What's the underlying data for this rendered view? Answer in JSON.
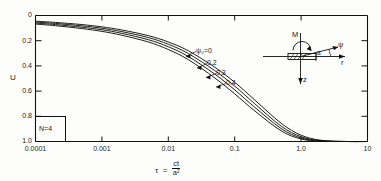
{
  "chart_data": {
    "type": "line",
    "title": "",
    "xlabel": "τ = ct/a²",
    "ylabel": "U",
    "xscale": "log",
    "xlim": [
      0.0001,
      10
    ],
    "ylim": [
      0,
      1.0
    ],
    "y_inverted": true,
    "grid": false,
    "legend_position": "inline-labels",
    "xticks": [
      0.0001,
      0.001,
      0.01,
      0.1,
      1.0,
      10
    ],
    "xticklabels": [
      "0.0001",
      "0.001",
      "0.01",
      "0.1",
      "1.0",
      "10"
    ],
    "yticks": [
      0,
      0.2,
      0.4,
      0.6,
      0.8,
      1.0
    ],
    "yticklabels": [
      "0",
      "0.2",
      "0.4",
      "0.6",
      "0.8",
      "1.0"
    ],
    "annotations": [
      {
        "name": "n-value-box",
        "text": "N=4"
      }
    ],
    "series": [
      {
        "name": "ψ=0",
        "label": "ψ₀=0",
        "x": [
          0.0001,
          0.0002,
          0.0005,
          0.001,
          0.002,
          0.005,
          0.01,
          0.02,
          0.05,
          0.1,
          0.2,
          0.5,
          1.0,
          2.0,
          5.0,
          10.0
        ],
        "y": [
          0.045,
          0.055,
          0.072,
          0.09,
          0.115,
          0.16,
          0.21,
          0.28,
          0.41,
          0.53,
          0.67,
          0.855,
          0.95,
          0.99,
          1.0,
          1.0
        ]
      },
      {
        "name": "ψ=0.2",
        "label": "0.2",
        "x": [
          0.0001,
          0.0002,
          0.0005,
          0.001,
          0.002,
          0.005,
          0.01,
          0.02,
          0.05,
          0.1,
          0.2,
          0.5,
          1.0,
          2.0,
          5.0,
          10.0
        ],
        "y": [
          0.052,
          0.063,
          0.082,
          0.101,
          0.128,
          0.175,
          0.228,
          0.302,
          0.437,
          0.56,
          0.7,
          0.878,
          0.962,
          0.994,
          1.0,
          1.0
        ]
      },
      {
        "name": "ψ=0.3",
        "label": "0.3",
        "x": [
          0.0001,
          0.0002,
          0.0005,
          0.001,
          0.002,
          0.005,
          0.01,
          0.02,
          0.05,
          0.1,
          0.2,
          0.5,
          1.0,
          2.0,
          5.0,
          10.0
        ],
        "y": [
          0.06,
          0.072,
          0.093,
          0.113,
          0.142,
          0.192,
          0.248,
          0.325,
          0.465,
          0.59,
          0.728,
          0.897,
          0.972,
          0.996,
          1.0,
          1.0
        ]
      },
      {
        "name": "ψ=0.4",
        "label": "0.4",
        "x": [
          0.0001,
          0.0002,
          0.0005,
          0.001,
          0.002,
          0.005,
          0.01,
          0.02,
          0.05,
          0.1,
          0.2,
          0.5,
          1.0,
          2.0,
          5.0,
          10.0
        ],
        "y": [
          0.068,
          0.081,
          0.104,
          0.126,
          0.157,
          0.21,
          0.27,
          0.35,
          0.495,
          0.622,
          0.757,
          0.915,
          0.98,
          0.998,
          1.0,
          1.0
        ]
      }
    ]
  },
  "inset": {
    "name": "loading-geometry-diagram",
    "moment_label": "M",
    "angle_label": "ψ",
    "radial_axis_label": "r",
    "vertical_axis_label": "z",
    "width_label": "a"
  },
  "axis": {
    "x_title_symbol": "τ",
    "x_title_equals": "=",
    "x_title_numerator": "ct",
    "x_title_denominator": "a²"
  }
}
